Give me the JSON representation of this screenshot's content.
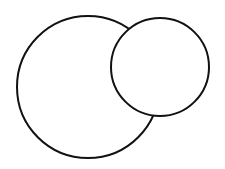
{
  "diagram": {
    "background": "#ffffff",
    "stroke_color": "#111111",
    "stroke_width": 2,
    "shapes": [
      {
        "id": "large-circle",
        "type": "circle",
        "cx": 88,
        "cy": 87,
        "r": 71,
        "fill": "#ffffff"
      },
      {
        "id": "small-circle",
        "type": "circle",
        "cx": 160,
        "cy": 67,
        "r": 49,
        "fill": "#ffffff"
      }
    ]
  }
}
